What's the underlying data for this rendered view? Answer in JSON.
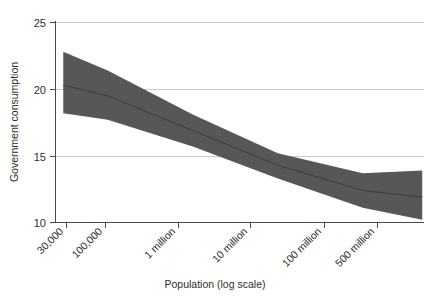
{
  "chart_data": {
    "type": "line",
    "title": "",
    "subtitle": "",
    "xlabel": "Population (log scale)",
    "ylabel": "Government consumption",
    "grid": true,
    "legend": null,
    "x_scale": "log",
    "xlim_log10": [
      4.38,
      8.72
    ],
    "ylim": [
      10,
      25
    ],
    "y_ticks": [
      10,
      15,
      20,
      25
    ],
    "y_tick_labels": [
      "10",
      "15",
      "20",
      "25"
    ],
    "x_ticks": [
      30000,
      100000,
      1000000,
      10000000,
      100000000,
      500000000
    ],
    "x_tick_labels": [
      "30,000",
      "100,000",
      "1 million",
      "10 million",
      "100 million",
      "500 million"
    ],
    "band_color": "#575857",
    "line_color": "#3c3c3c",
    "grid_color": "#c9c9c9",
    "axis_color": "#4a4a4a",
    "series": [
      {
        "name": "Fitted regression line",
        "x": [
          30000,
          100000,
          1000000,
          10000000,
          100000000,
          500000000
        ],
        "values": [
          20.3,
          19.5,
          16.9,
          14.3,
          12.4,
          11.9
        ]
      },
      {
        "name": "Confidence band upper",
        "x": [
          30000,
          100000,
          1000000,
          10000000,
          100000000,
          500000000
        ],
        "values": [
          22.8,
          21.4,
          18.1,
          15.2,
          13.7,
          13.9
        ]
      },
      {
        "name": "Confidence band lower",
        "x": [
          30000,
          100000,
          1000000,
          10000000,
          100000000,
          500000000
        ],
        "values": [
          18.2,
          17.7,
          15.7,
          13.3,
          11.1,
          10.2
        ]
      }
    ],
    "annotations": []
  },
  "axes": {
    "ylabel": "Government consumption",
    "xlabel": "Population (log scale)",
    "y_tick_labels": [
      "25",
      "20",
      "15",
      "10"
    ],
    "x_tick_labels": [
      "30,000",
      "100,000",
      "1 million",
      "10 million",
      "100 million",
      "500 million"
    ]
  }
}
